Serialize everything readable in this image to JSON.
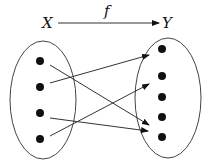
{
  "diagram": {
    "domain_label": "X",
    "codomain_label": "Y",
    "function_label": "f",
    "colors": {
      "stroke": "#333333",
      "dot": "#111111",
      "background": "#ffffff"
    },
    "domain_set": {
      "ellipse": {
        "cx": 43,
        "cy": 100,
        "rx": 33,
        "ry": 59
      },
      "elements": [
        {
          "id": "x1",
          "x": 40,
          "y": 61
        },
        {
          "id": "x2",
          "x": 40,
          "y": 87
        },
        {
          "id": "x3",
          "x": 40,
          "y": 113
        },
        {
          "id": "x4",
          "x": 40,
          "y": 139
        }
      ]
    },
    "codomain_set": {
      "ellipse": {
        "cx": 168,
        "cy": 98,
        "rx": 33,
        "ry": 60
      },
      "elements": [
        {
          "id": "y1",
          "x": 162,
          "y": 49
        },
        {
          "id": "y2",
          "x": 162,
          "y": 76
        },
        {
          "id": "y3",
          "x": 162,
          "y": 97
        },
        {
          "id": "y4",
          "x": 162,
          "y": 117
        },
        {
          "id": "y5",
          "x": 162,
          "y": 137
        }
      ]
    },
    "mappings": [
      {
        "from": "x1",
        "x1": 50,
        "y1": 65,
        "x2": 149,
        "y2": 125
      },
      {
        "from": "x2",
        "x1": 50,
        "y1": 83,
        "x2": 149,
        "y2": 55
      },
      {
        "from": "x3",
        "x1": 50,
        "y1": 118,
        "x2": 148,
        "y2": 131
      },
      {
        "from": "x4",
        "x1": 50,
        "y1": 136,
        "x2": 149,
        "y2": 84
      }
    ],
    "top_arrow": {
      "x1": 58,
      "y1": 23,
      "x2": 159,
      "y2": 23
    }
  }
}
